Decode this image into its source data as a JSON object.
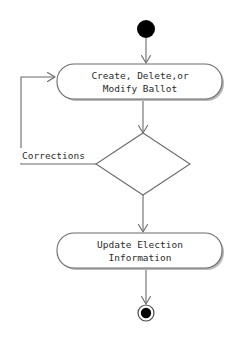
{
  "diagram": {
    "type": "uml-activity-diagram",
    "title": "",
    "background_color": "#ffffff",
    "stroke_color": "#6b6b6b",
    "node_fill_color": "#ffffff",
    "node_stroke_color": "#6b6b6b",
    "shadow_color": "#b9b9b9",
    "text_color": "#2b2b2b",
    "marker_fill_color": "#000000",
    "nodes": [
      {
        "id": "start",
        "kind": "initial-node",
        "icon": "filled-circle-icon",
        "label": "",
        "cx": 146,
        "cy": 29,
        "r": 9
      },
      {
        "id": "activity-create-ballot",
        "kind": "activity",
        "label_lines": [
          "Create, Delete,or",
          "Modify Ballot"
        ],
        "x": 57,
        "y": 64,
        "width": 165,
        "height": 35,
        "rx": 17
      },
      {
        "id": "decision",
        "kind": "decision-node",
        "label": "",
        "cx": 143,
        "cy": 164,
        "half_width": 47,
        "half_height": 31
      },
      {
        "id": "activity-update-election",
        "kind": "activity",
        "label_lines": [
          "Update Election",
          "Information"
        ],
        "x": 57,
        "y": 233,
        "width": 165,
        "height": 35,
        "rx": 17
      },
      {
        "id": "end",
        "kind": "final-node",
        "icon": "bullseye-circle-icon",
        "label": "",
        "cx": 146,
        "cy": 313,
        "outer_r": 8,
        "inner_r": 5
      }
    ],
    "edges": [
      {
        "id": "edge-start-to-create",
        "from": "start",
        "to": "activity-create-ballot",
        "label": "",
        "arrow": "open"
      },
      {
        "id": "edge-create-to-decision",
        "from": "activity-create-ballot",
        "to": "decision",
        "label": "",
        "arrow": "open"
      },
      {
        "id": "edge-decision-to-create",
        "from": "decision",
        "to": "activity-create-ballot",
        "label": "Corrections",
        "arrow": "open",
        "label_x": 22,
        "label_y": 156
      },
      {
        "id": "edge-decision-to-update",
        "from": "decision",
        "to": "activity-update-election",
        "label": "",
        "arrow": "open"
      },
      {
        "id": "edge-update-to-end",
        "from": "activity-update-election",
        "to": "end",
        "label": "",
        "arrow": "open"
      }
    ]
  }
}
